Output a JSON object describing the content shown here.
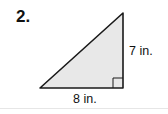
{
  "problem": {
    "number": "2."
  },
  "triangle": {
    "type": "right-triangle",
    "fill": "#e8e8e8",
    "stroke": "#1a1a1a",
    "height_label": "7 in.",
    "base_label": "8 in.",
    "right_angle_marker": true
  }
}
